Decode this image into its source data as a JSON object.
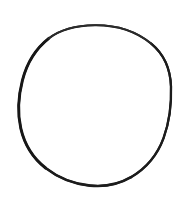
{
  "image": {
    "kind": "line-drawing",
    "subject": "hand-drawn circle outline",
    "width": 194,
    "height": 197,
    "background_color": "#FFFFFF",
    "has_text": false,
    "text_content": ""
  },
  "canvas": {
    "name": "drawing-canvas",
    "background_color": "#FFFFFF"
  },
  "shapes": [
    {
      "id": "circle-outline",
      "type": "ellipse-freehand",
      "label": "circle",
      "stroke_color": "#171717",
      "fill_color": "none",
      "stroke_width_min": 1.6,
      "stroke_width_max": 3.0,
      "center_x": 95,
      "center_y": 105,
      "radius_x": 76,
      "radius_y": 80.5,
      "bounds": {
        "left": 19,
        "top": 25,
        "right": 171,
        "bottom": 186
      },
      "path": "M 95.0 25.2 C 116.5 25.0 136.5 31.6 151.2 43.6 C 163.8 54.0 170.4 69.0 171.0 86.5 C 171.6 104.0 169.4 122.0 163.6 138.0 C 157.6 154.4 146.0 168.4 131.0 177.2 C 118.6 184.5 104.0 187.0 90.0 185.6 C 74.0 184.0 58.4 178.0 45.6 168.0 C 33.0 158.2 24.4 144.0 20.8 128.4 C 17.2 112.8 18.4 96.0 22.4 80.4 C 26.6 64.0 35.6 48.8 48.8 38.4 C 61.8 28.2 78.2 25.4 95.0 25.2 Z"
    }
  ],
  "colors": {
    "ink": "#171717",
    "ink_light": "#3A3A3A",
    "paper": "#FFFFFF"
  }
}
